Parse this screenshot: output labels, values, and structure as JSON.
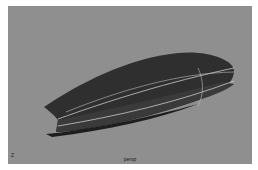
{
  "viewport": {
    "camera_label": "persp",
    "axis_indicator": "Z",
    "background_color": "#8f8f8f",
    "model": {
      "name": "boat-hull-surface",
      "body_color": "#2e2e2e",
      "isoparm_color": "#c8c8c8"
    }
  }
}
